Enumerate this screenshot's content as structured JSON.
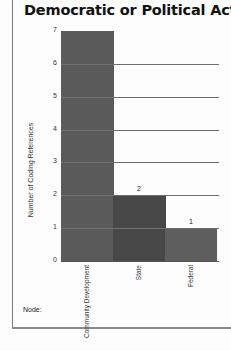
{
  "header": {
    "title": "Democratic or Political Action"
  },
  "footer": {
    "node_label": "Node:"
  },
  "chart_data": {
    "type": "bar",
    "title": "Democratic or Political Action",
    "xlabel": "",
    "ylabel": "Number of Coding References",
    "categories": [
      "Community Development",
      "State",
      "Federal"
    ],
    "values": [
      7,
      2,
      1
    ],
    "data_labels": [
      "",
      "2",
      "1"
    ],
    "bar_colors": [
      "#5a5a5a",
      "#474747",
      "#5e5e5e"
    ],
    "ylim": [
      0,
      7
    ],
    "yticks": [
      "0",
      "1",
      "2",
      "3",
      "4",
      "5",
      "6",
      "7"
    ],
    "grid": true,
    "legend": "none"
  }
}
